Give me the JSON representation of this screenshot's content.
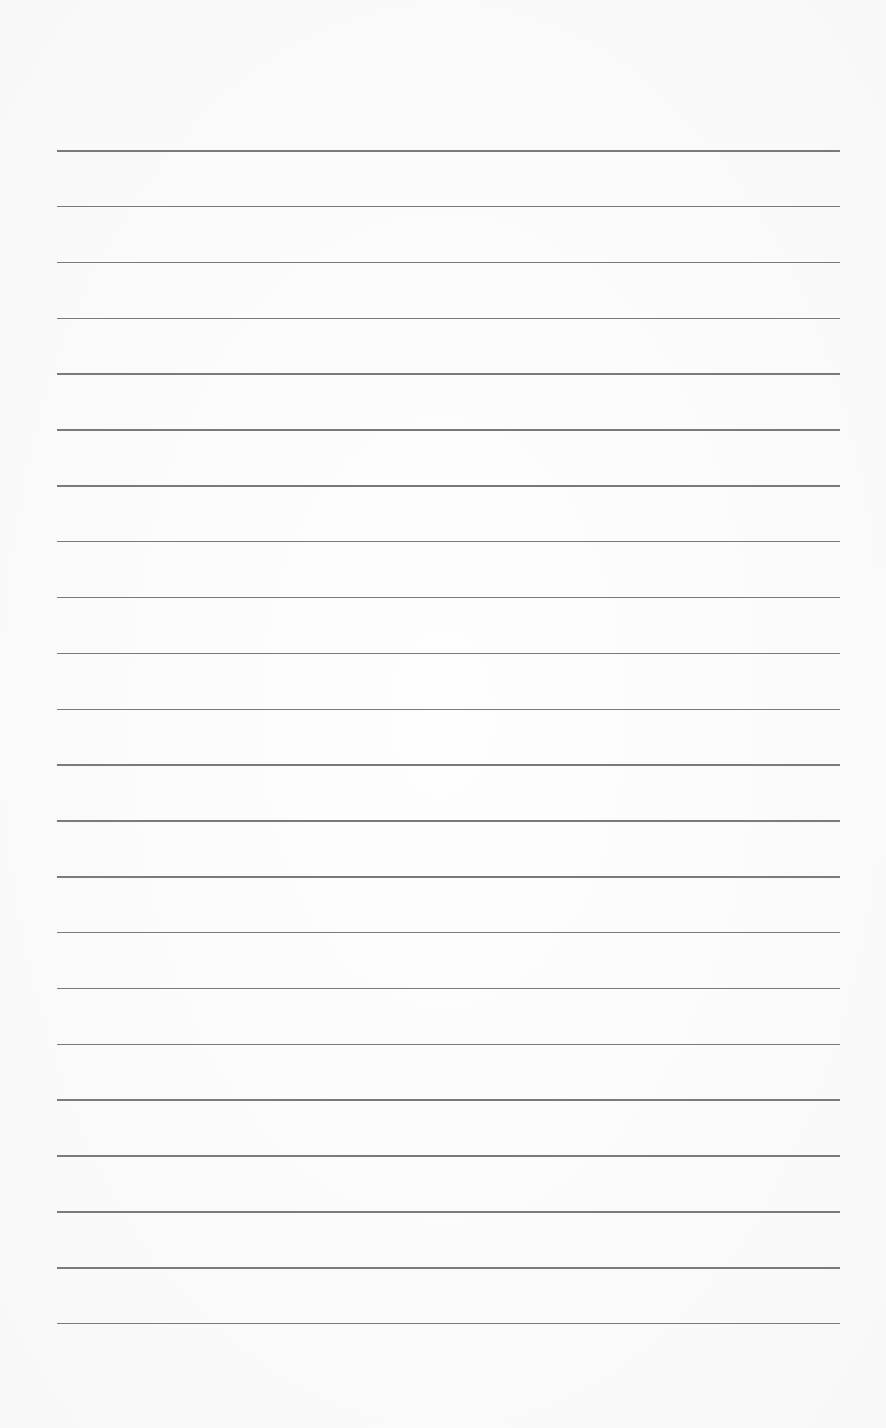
{
  "page": {
    "type": "lined-paper",
    "background_color": "#fbfbfb",
    "line_color": "#7a7a7a",
    "line_count": 22,
    "line_left": 57,
    "line_right": 840,
    "first_line_y": 150,
    "line_spacing": 55.85
  }
}
